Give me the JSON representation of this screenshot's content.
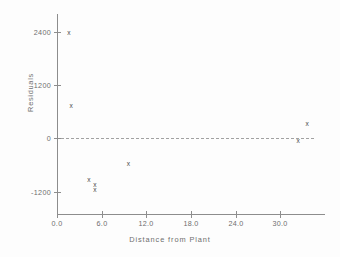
{
  "chart_data": {
    "type": "scatter",
    "title": "",
    "xlabel": "Distance from Plant",
    "ylabel": "Residuals",
    "xlim": [
      0.0,
      36.0
    ],
    "ylim": [
      -1700,
      2800
    ],
    "grid": false,
    "legend": false,
    "marker_symbol": "x",
    "xticks": [
      0.0,
      6.0,
      12.0,
      18.0,
      24.0,
      30.0
    ],
    "xtick_labels": [
      "0.0",
      "6.0",
      "12.0",
      "18.0",
      "24.0",
      "30.0"
    ],
    "yticks": [
      2400,
      1200,
      0,
      -1200
    ],
    "ytick_labels": [
      "2400",
      "1200",
      "0",
      "-1200"
    ],
    "reference_line": {
      "y": 0,
      "style": "dash-dot",
      "x_start": 0.6,
      "x_end": 34.5
    },
    "points": [
      {
        "x": 1.6,
        "y": 2380
      },
      {
        "x": 1.9,
        "y": 730
      },
      {
        "x": 4.3,
        "y": -930
      },
      {
        "x": 5.1,
        "y": -1040
      },
      {
        "x": 5.1,
        "y": -1150
      },
      {
        "x": 9.6,
        "y": -570
      },
      {
        "x": 33.6,
        "y": 320
      },
      {
        "x": 32.4,
        "y": -60
      }
    ]
  },
  "axis_color": "#8d8d8d",
  "text_color": "#6e6e6e",
  "marker_color": "#4a4a4a"
}
